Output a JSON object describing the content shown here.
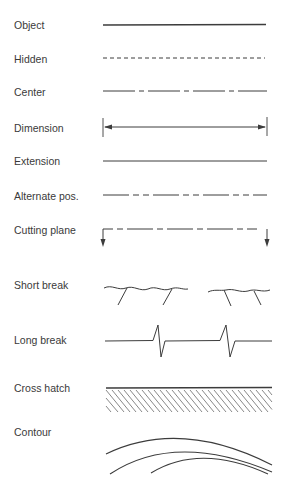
{
  "colors": {
    "line": "#3c3c3c",
    "text": "#3a3a3a",
    "background": "#ffffff"
  },
  "rows": [
    {
      "id": "object",
      "label": "Object",
      "style": "solid-thick"
    },
    {
      "id": "hidden",
      "label": "Hidden",
      "style": "short-dashes"
    },
    {
      "id": "center",
      "label": "Center",
      "style": "long-short-dash"
    },
    {
      "id": "dimension",
      "label": "Dimension",
      "style": "double-arrow-with-extension-ticks"
    },
    {
      "id": "extension",
      "label": "Extension",
      "style": "solid-thin"
    },
    {
      "id": "alternate",
      "label": "Alternate pos.",
      "style": "long-double-short-dash"
    },
    {
      "id": "cutting-plane",
      "label": "Cutting plane",
      "style": "long-double-short-dash-with-down-arrows"
    },
    {
      "id": "short-break",
      "label": "Short break",
      "style": "wavy-freehand"
    },
    {
      "id": "long-break",
      "label": "Long break",
      "style": "zigzag"
    },
    {
      "id": "cross-hatch",
      "label": "Cross hatch",
      "style": "diagonal-hatching"
    },
    {
      "id": "contour",
      "label": "Contour",
      "style": "nested-arcs"
    }
  ]
}
